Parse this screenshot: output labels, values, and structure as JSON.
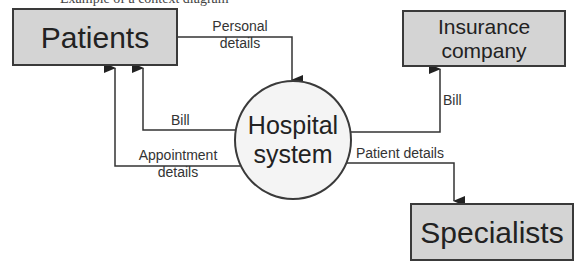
{
  "caption": "Example of a context diagram",
  "entities": {
    "patients": "Patients",
    "insurance": "Insurance company",
    "specialists": "Specialists"
  },
  "process": {
    "label_line1": "Hospital",
    "label_line2": "system"
  },
  "flows": {
    "personal_details": {
      "line1": "Personal",
      "line2": "details"
    },
    "bill_patients": "Bill",
    "appointment_details": {
      "line1": "Appointment",
      "line2": "details"
    },
    "bill_insurance": "Bill",
    "patient_details": "Patient details"
  },
  "colors": {
    "entity_fill": "#d4d4d4",
    "process_fill": "#f4f4f4",
    "stroke": "#3a3a3a"
  }
}
